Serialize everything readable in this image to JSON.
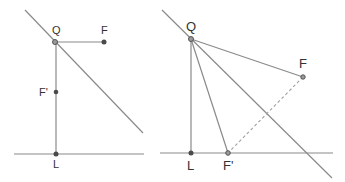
{
  "figures": [
    {
      "id": "left",
      "labels": {
        "Q": "Q",
        "F": "F",
        "Fprime": "F'",
        "L": "L"
      },
      "points": {
        "Q": {
          "x": 55,
          "y": 42
        },
        "F": {
          "x": 104,
          "y": 42
        },
        "Fprime": {
          "x": 56,
          "y": 92
        },
        "L": {
          "x": 56,
          "y": 154
        }
      },
      "lines": {
        "diagonal": {
          "x1": 25,
          "y1": 10,
          "x2": 143,
          "y2": 133
        },
        "baseline": {
          "x1": 14,
          "y1": 154,
          "x2": 144,
          "y2": 154
        }
      }
    },
    {
      "id": "right",
      "labels": {
        "Q": "Q",
        "F": "F",
        "Fprime": "F'",
        "L": "L"
      },
      "points": {
        "Q": {
          "x": 191,
          "y": 39
        },
        "F": {
          "x": 303,
          "y": 77
        },
        "Fprime": {
          "x": 228,
          "y": 153
        },
        "L": {
          "x": 191,
          "y": 153
        }
      },
      "lines": {
        "diagonal": {
          "x1": 162,
          "y1": 10,
          "x2": 332,
          "y2": 178
        },
        "baseline": {
          "x1": 160,
          "y1": 153,
          "x2": 333,
          "y2": 153
        }
      }
    }
  ],
  "colors": {
    "line": "#8a8a8a",
    "point": "#4a4a4a",
    "label": "#333333"
  }
}
